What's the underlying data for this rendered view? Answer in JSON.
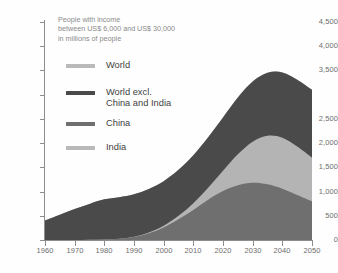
{
  "chart_data": {
    "type": "area",
    "title": "People with income between US$ 6,000 and US$ 30,000 in millions of people",
    "title_lines": [
      "People with income",
      "between US$ 6,000 and US$ 30,000",
      "in millions of people"
    ],
    "xlabel": "",
    "ylabel": "",
    "stacked": true,
    "grid": false,
    "legend_position": "inside-top-left",
    "xlim": [
      1960,
      2050
    ],
    "ylim": [
      0,
      4500
    ],
    "xticks": [
      1960,
      1970,
      1980,
      1990,
      2000,
      2010,
      2020,
      2030,
      2040,
      2050
    ],
    "xtick_labels": [
      "1960",
      "1970",
      "1980",
      "1990",
      "2000",
      "2010",
      "2020",
      "2030",
      "2040",
      "2050"
    ],
    "yticks": [
      0,
      500,
      1000,
      1500,
      2000,
      2500,
      3000,
      3500,
      4000,
      4500
    ],
    "ytick_labels": [
      "0",
      "500",
      "1,000",
      "1,500",
      "2,000",
      "2,500",
      "",
      "3,500",
      "4,000",
      "4,500"
    ],
    "note": "The 3,000 tick label is absent in the printed source; its tick mark remains.",
    "x": [
      1960,
      1965,
      1970,
      1975,
      1980,
      1985,
      1990,
      1995,
      2000,
      2005,
      2010,
      2015,
      2020,
      2025,
      2030,
      2035,
      2040,
      2045,
      2050
    ],
    "series": [
      {
        "name": "China",
        "color": "#6f6f6f",
        "order": 1,
        "values": [
          0,
          0,
          0,
          5,
          10,
          25,
          60,
          140,
          260,
          430,
          620,
          830,
          1010,
          1130,
          1180,
          1150,
          1060,
          930,
          800
        ]
      },
      {
        "name": "India",
        "color": "#b4b4b4",
        "order": 2,
        "values": [
          0,
          0,
          0,
          0,
          0,
          0,
          5,
          15,
          35,
          70,
          140,
          250,
          420,
          640,
          850,
          1000,
          1050,
          1000,
          900
        ]
      },
      {
        "name": "World excl. China and India",
        "color": "#4a4a4a",
        "order": 3,
        "values": [
          400,
          520,
          640,
          740,
          830,
          860,
          880,
          900,
          920,
          950,
          990,
          1040,
          1100,
          1170,
          1240,
          1300,
          1350,
          1380,
          1400
        ]
      },
      {
        "name": "World",
        "color": "#a8a8a8",
        "order": 4,
        "is_total_envelope": true,
        "values": [
          400,
          520,
          640,
          745,
          840,
          885,
          945,
          1055,
          1215,
          1450,
          1750,
          2120,
          2530,
          2940,
          3270,
          3450,
          3460,
          3310,
          3100
        ]
      }
    ]
  },
  "legend": {
    "items": [
      {
        "label": "World",
        "label2": "",
        "color": "#b9b9b9"
      },
      {
        "label": "World excl.",
        "label2": "China and India",
        "color": "#4a4a4a"
      },
      {
        "label": "China",
        "label2": "",
        "color": "#6f6f6f"
      },
      {
        "label": "India",
        "label2": "",
        "color": "#b9b9b9"
      }
    ]
  },
  "colors": {
    "axis": "#8c8c8c",
    "tick_text": "#6d6d6d",
    "title_text": "#8a8a8a",
    "legend_text": "#3f3f3f",
    "background": "#ffffff"
  }
}
